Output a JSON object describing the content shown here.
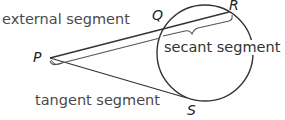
{
  "diagram": {
    "labels": {
      "external": "external segment",
      "secant": "secant segment",
      "tangent": "tangent segment"
    },
    "points": {
      "P": "P",
      "Q": "Q",
      "R": "R",
      "S": "S"
    },
    "colors": {
      "line": "#3a3a3a",
      "text": "#4a4a4a"
    }
  }
}
